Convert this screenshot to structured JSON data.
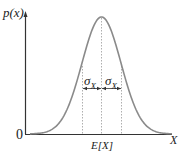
{
  "diagram": {
    "y_axis_label": "p(x)",
    "x_axis_label": "X",
    "origin_label": "0",
    "mean_label": "E[X]",
    "sigma_left_label": "σX",
    "sigma_right_label": "σX",
    "sigma_symbol": "σ",
    "sigma_subscript": "X",
    "colors": {
      "curve": "#8a8a8a",
      "axes": "#333333",
      "dashed": "#9a9a9a",
      "text": "#222222"
    }
  },
  "chart_data": {
    "type": "line",
    "title": "",
    "xlabel": "X",
    "ylabel": "p(x)",
    "series": [
      {
        "name": "Gaussian PDF",
        "description": "bell curve centered at E[X] with standard deviation σX"
      }
    ],
    "annotations": [
      "E[X]",
      "σX (left of mean)",
      "σX (right of mean)"
    ],
    "grid": false
  }
}
